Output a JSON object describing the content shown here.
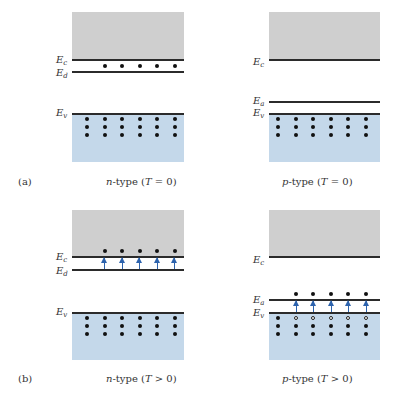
{
  "figure": {
    "panels": [
      {
        "id": "a-n",
        "row_label": "(a)",
        "type_prefix": "n",
        "caption_rest": "-type (",
        "T": "T",
        "relation": " = 0)",
        "levels": [
          "E",
          "c",
          "E",
          "d",
          "E",
          "v"
        ]
      },
      {
        "id": "a-p",
        "type_prefix": "p",
        "caption_rest": "-type (",
        "T": "T",
        "relation": " = 0)",
        "levels": [
          "E",
          "c",
          "E",
          "a",
          "E",
          "v"
        ]
      },
      {
        "id": "b-n",
        "row_label": "(b)",
        "type_prefix": "n",
        "caption_rest": "-type (",
        "T": "T",
        "relation": " > 0)",
        "levels": [
          "E",
          "c",
          "E",
          "d",
          "E",
          "v"
        ]
      },
      {
        "id": "b-p",
        "type_prefix": "p",
        "caption_rest": "-type (",
        "T": "T",
        "relation": " > 0)",
        "levels": [
          "E",
          "c",
          "E",
          "a",
          "E",
          "v"
        ]
      }
    ],
    "labels": {
      "E": "E",
      "c": "c",
      "d": "d",
      "a": "a",
      "v": "v",
      "row_a": "(a)",
      "row_b": "(b)",
      "n": "n",
      "p": "p",
      "T": "T",
      "type_open": "-type (",
      "eq_zero": " = 0)",
      "gt_zero": " > 0)"
    },
    "colors": {
      "conduction_band": "#cfcfcf",
      "valence_band": "#c4d8ea",
      "arrow": "#2d63ad",
      "level_line": "#2b2b2b"
    }
  }
}
